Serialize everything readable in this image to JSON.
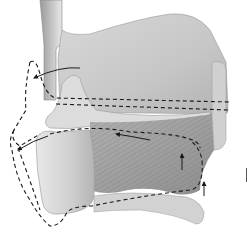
{
  "figure": {
    "colors": {
      "background": "#ffffff",
      "tissue_light": "#e4e4e4",
      "tissue_mid": "#c4c4c4",
      "tissue_dark": "#8a8a8a",
      "outline_dashed": "#1a1a1a"
    },
    "elements": [
      {
        "name": "vertical-tube",
        "description": "Curved tubular structure descending from top"
      },
      {
        "name": "large-plate",
        "description": "Large shaded plate-like structure upper right"
      },
      {
        "name": "lower-cartilage",
        "description": "Rounded cartilage at lower left"
      },
      {
        "name": "muscle-fibers",
        "description": "Striated muscle fibers in lower middle"
      },
      {
        "name": "dashed-paths",
        "description": "Dashed outlines showing displaced position"
      },
      {
        "name": "movement-arrows",
        "description": "Arrows indicating direction of movement"
      }
    ]
  }
}
